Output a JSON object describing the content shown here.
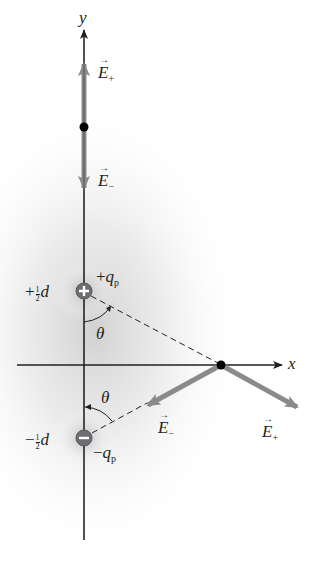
{
  "diagram": {
    "type": "electric-dipole-field",
    "colors": {
      "axis": "#231f20",
      "field_vector": "#8a8a8a",
      "charge_fill": "#6d6e71",
      "point": "#000000",
      "glow": "#cfcfcf"
    },
    "axes": {
      "x_label": "x",
      "y_label": "y"
    },
    "charges": [
      {
        "name": "positive",
        "sign": "+",
        "position_label_sign": "+",
        "position_label_frac": "1/2",
        "position_label_var": "d",
        "charge_label_sign": "+",
        "charge_label_var": "q",
        "charge_label_sub": "p"
      },
      {
        "name": "negative",
        "sign": "−",
        "position_label_sign": "−",
        "position_label_frac": "1/2",
        "position_label_var": "d",
        "charge_label_sign": "−",
        "charge_label_var": "q",
        "charge_label_sub": "p"
      }
    ],
    "angles": [
      {
        "label": "θ"
      },
      {
        "label": "θ"
      }
    ],
    "field_points": [
      {
        "location": "on y-axis",
        "vectors": [
          {
            "label_var": "E",
            "label_sub": "+"
          },
          {
            "label_var": "E",
            "label_sub": "−"
          }
        ]
      },
      {
        "location": "on x-axis",
        "vectors": [
          {
            "label_var": "E",
            "label_sub": "−"
          },
          {
            "label_var": "E",
            "label_sub": "+"
          }
        ]
      }
    ],
    "fraction": {
      "num": "1",
      "den": "2"
    }
  }
}
